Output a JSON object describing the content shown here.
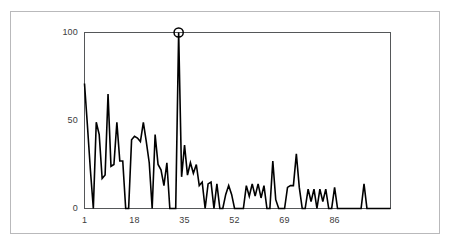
{
  "figure": {
    "frame_color": "#b9b9bb",
    "background": "#ffffff",
    "line_color": "#000000",
    "tick_text_color": "#3c3c3c"
  },
  "chart_data": {
    "type": "line",
    "title": "",
    "subtitle": "",
    "xlabel": "",
    "ylabel": "",
    "xlim": [
      1,
      105
    ],
    "ylim": [
      0,
      100
    ],
    "grid": false,
    "legend": null,
    "xticks": [
      1,
      18,
      35,
      52,
      69,
      86
    ],
    "xtick_labels": [
      "1",
      "18",
      "35",
      "52",
      "69",
      "86"
    ],
    "yticks": [
      0,
      50,
      100
    ],
    "ytick_labels": [
      "0",
      "50",
      "100"
    ],
    "annotations": [
      {
        "marker": "circle-open",
        "x": 33,
        "y": 100,
        "label": ""
      }
    ],
    "x": [
      1,
      2,
      3,
      4,
      5,
      6,
      7,
      8,
      9,
      10,
      11,
      12,
      13,
      14,
      15,
      16,
      17,
      18,
      19,
      20,
      21,
      22,
      23,
      24,
      25,
      26,
      27,
      28,
      29,
      30,
      31,
      32,
      33,
      34,
      35,
      36,
      37,
      38,
      39,
      40,
      41,
      42,
      43,
      44,
      45,
      46,
      47,
      48,
      49,
      50,
      51,
      52,
      53,
      54,
      55,
      56,
      57,
      58,
      59,
      60,
      61,
      62,
      63,
      64,
      65,
      66,
      67,
      68,
      69,
      70,
      71,
      72,
      73,
      74,
      75,
      76,
      77,
      78,
      79,
      80,
      81,
      82,
      83,
      84,
      85,
      86,
      87,
      88,
      89,
      90,
      91,
      92,
      93,
      94,
      95,
      96,
      97,
      98,
      99,
      100,
      101,
      102,
      103,
      104,
      105
    ],
    "values": [
      71,
      47,
      22,
      0,
      49,
      42,
      17,
      19,
      65,
      24,
      25,
      49,
      27,
      27,
      0,
      0,
      39,
      41,
      40,
      38,
      49,
      38,
      26,
      0,
      42,
      25,
      22,
      13,
      26,
      0,
      0,
      0,
      100,
      18,
      36,
      19,
      26,
      20,
      25,
      13,
      15,
      0,
      14,
      15,
      0,
      14,
      0,
      0,
      8,
      13,
      8,
      0,
      0,
      0,
      0,
      13,
      7,
      14,
      7,
      14,
      6,
      13,
      0,
      0,
      27,
      5,
      0,
      0,
      0,
      12,
      13,
      13,
      31,
      12,
      0,
      0,
      11,
      4,
      11,
      0,
      11,
      4,
      11,
      0,
      0,
      12,
      0,
      0,
      0,
      0,
      0,
      0,
      0,
      0,
      0,
      14,
      0,
      0,
      0,
      0,
      0,
      0,
      0,
      0,
      0
    ],
    "series_name": "signal"
  }
}
